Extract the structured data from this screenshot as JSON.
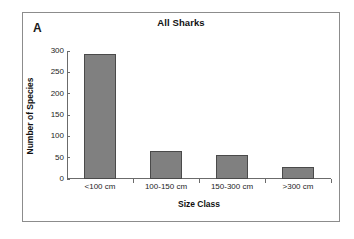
{
  "figure": {
    "panel_label": "A",
    "border_color": "#8c8c8c",
    "background": "#ffffff"
  },
  "chart_data": {
    "type": "bar",
    "title": "All Sharks",
    "xlabel": "Size Class",
    "ylabel": "Number of Species",
    "categories": [
      "<100 cm",
      "100-150 cm",
      "150-300 cm",
      ">300 cm"
    ],
    "values": [
      292,
      66,
      56,
      28
    ],
    "ylim": [
      0,
      300
    ],
    "yticks": [
      0,
      50,
      100,
      150,
      200,
      250,
      300
    ],
    "ytick_labels": [
      "0",
      "50",
      "100",
      "150",
      "200",
      "250",
      "300"
    ],
    "grid": false,
    "legend": null,
    "bar_color": "#808080",
    "bar_edge_color": "#4a4a4a",
    "axis_color": "#6b6b6b"
  }
}
